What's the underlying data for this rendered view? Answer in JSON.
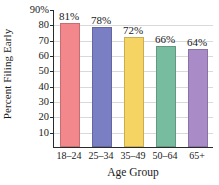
{
  "chart_data": {
    "type": "bar",
    "title": "",
    "xlabel": "Age Group",
    "ylabel": "Percent Filing Early",
    "categories": [
      "18–24",
      "25–34",
      "35–49",
      "50–64",
      "65+"
    ],
    "values": [
      81,
      78,
      72,
      66,
      64
    ],
    "data_labels": [
      "81%",
      "78%",
      "72%",
      "66%",
      "64%"
    ],
    "ylim": [
      0,
      90
    ],
    "ytick_values": [
      90,
      80,
      70,
      60,
      50,
      40,
      30,
      20,
      10
    ],
    "ytick_labels": [
      "90%",
      "80",
      "70",
      "60",
      "50",
      "40",
      "30",
      "20",
      "10"
    ],
    "grid": true,
    "legend": "none",
    "bar_colors": [
      "#F2888B",
      "#7A7EC2",
      "#F6D463",
      "#77BC9E",
      "#A98BC8"
    ]
  }
}
